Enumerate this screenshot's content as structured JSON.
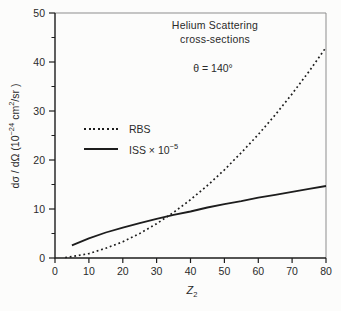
{
  "figure": {
    "title_line1": "Helium Scattering",
    "title_line2": "cross-sections",
    "annotation_theta": "θ = 140°",
    "legend": {
      "rbs_label": "RBS",
      "iss_label_base": "ISS × 10",
      "iss_label_exp": "−5"
    },
    "ylabel": {
      "pre": "dσ / dΩ (10",
      "exp1": "−24",
      "mid": " cm",
      "exp2": "2",
      "post": "/sr )"
    },
    "xlabel": {
      "base": "Z",
      "sub": "2"
    }
  },
  "chart_data": {
    "type": "line",
    "title": "Helium Scattering cross-sections",
    "annotation": "θ = 140°",
    "xlabel": "Z₂",
    "ylabel": "dσ/dΩ (10⁻²⁴ cm²/sr)",
    "xlim": [
      0,
      80
    ],
    "ylim": [
      0,
      50
    ],
    "x_ticks": [
      0,
      10,
      20,
      30,
      40,
      50,
      60,
      70,
      80
    ],
    "y_ticks": [
      0,
      10,
      20,
      30,
      40,
      50
    ],
    "y_minor_ticks": [
      5,
      15,
      25,
      35,
      45
    ],
    "grid": false,
    "legend_position": "inside-upper-left",
    "line_color": "#1d1d1d",
    "frame_color": "#8d8d8d",
    "series": [
      {
        "name": "RBS",
        "line_style": "dotted",
        "x": [
          3,
          5,
          10,
          15,
          20,
          25,
          30,
          35,
          40,
          45,
          50,
          55,
          60,
          65,
          70,
          75,
          80
        ],
        "y": [
          0.1,
          0.3,
          0.9,
          2.0,
          3.3,
          5.0,
          7.0,
          9.3,
          11.9,
          14.8,
          18.0,
          21.5,
          25.2,
          29.2,
          33.5,
          38.1,
          43.0
        ]
      },
      {
        "name": "ISS × 10⁻⁵",
        "line_style": "solid",
        "x": [
          5,
          10,
          15,
          20,
          25,
          30,
          35,
          40,
          45,
          50,
          55,
          60,
          65,
          70,
          75,
          80
        ],
        "y": [
          2.6,
          4.0,
          5.2,
          6.2,
          7.1,
          8.0,
          8.8,
          9.5,
          10.3,
          11.0,
          11.6,
          12.3,
          12.9,
          13.5,
          14.1,
          14.7
        ]
      }
    ]
  }
}
